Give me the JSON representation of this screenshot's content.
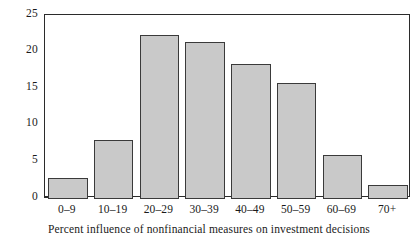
{
  "chart_data": {
    "type": "bar",
    "title": "",
    "subtitle": "",
    "xlabel": "Percent influence of nonfinancial measures on investment decisions",
    "ylabel": "",
    "categories": [
      "0–9",
      "10–19",
      "20–29",
      "30–39",
      "40–49",
      "50–59",
      "60–69",
      "70+"
    ],
    "values": [
      2.8,
      7.9,
      22.3,
      21.3,
      18.3,
      15.7,
      5.9,
      1.8
    ],
    "ylim": [
      0,
      25
    ],
    "yticks": [
      0,
      5,
      10,
      15,
      20,
      25
    ],
    "ytick_labels": [
      "0",
      "5",
      "10",
      "15",
      "20",
      "25"
    ],
    "grid": false,
    "legend": false,
    "legend_position": "none",
    "bar_fill_color": "#c9c9c9",
    "bar_edge_color": "#3a3a3a",
    "axis_color": "#2b2b2b",
    "background_color": "#ffffff"
  },
  "axes": {
    "x_title": "Percent influence of nonfinancial measures on investment decisions"
  }
}
